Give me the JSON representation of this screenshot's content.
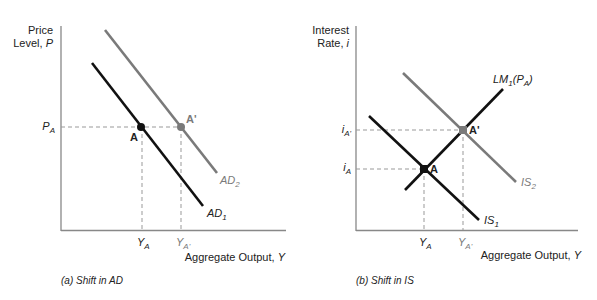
{
  "panels": [
    {
      "id": "a",
      "caption": "(a) Shift in AD",
      "y_axis_label_line1": "Price",
      "y_axis_label_line2": "Level, ",
      "y_axis_var": "P",
      "x_axis_label": "Aggregate Output, ",
      "x_axis_var": "Y",
      "y_tick": {
        "base": "P",
        "sub": "A"
      },
      "x_ticks": [
        {
          "base": "Y",
          "sub": "A"
        },
        {
          "base": "Y",
          "sub": "A'"
        }
      ],
      "points": [
        {
          "label": "A",
          "color": "#111111"
        },
        {
          "label": "A'",
          "color": "#7a7a7a"
        }
      ],
      "curves": [
        {
          "name": "AD1",
          "base": "AD",
          "sub": "1",
          "color": "#111111"
        },
        {
          "name": "AD2",
          "base": "AD",
          "sub": "2",
          "color": "#7a7a7a"
        }
      ]
    },
    {
      "id": "b",
      "caption": "(b) Shift in IS",
      "y_axis_label_line1": "Interest",
      "y_axis_label_line2": "Rate, ",
      "y_axis_var": "i",
      "x_axis_label": "Aggregate Output, ",
      "x_axis_var": "Y",
      "y_ticks": [
        {
          "base": "i",
          "sub": "A'"
        },
        {
          "base": "i",
          "sub": "A"
        }
      ],
      "x_ticks": [
        {
          "base": "Y",
          "sub": "A"
        },
        {
          "base": "Y",
          "sub": "A'"
        }
      ],
      "points": [
        {
          "label": "A",
          "color": "#111111"
        },
        {
          "label": "A'",
          "color": "#7a7a7a"
        }
      ],
      "curves": [
        {
          "name": "LM1(PA)",
          "base": "LM",
          "sub": "1",
          "suffix_open": "(",
          "suffix_var": "P",
          "suffix_sub": "A",
          "suffix_close": ")",
          "color": "#111111"
        },
        {
          "name": "IS1",
          "base": "IS",
          "sub": "1",
          "color": "#111111"
        },
        {
          "name": "IS2",
          "base": "IS",
          "sub": "2",
          "color": "#7a7a7a"
        }
      ]
    }
  ]
}
